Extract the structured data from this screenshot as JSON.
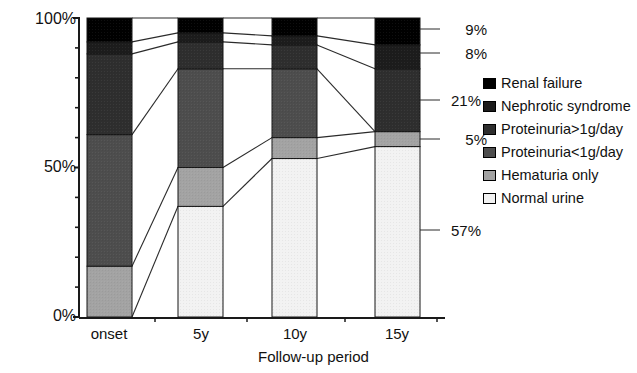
{
  "chart_data": {
    "type": "bar",
    "subtype": "100% stacked bar with connecting bands",
    "title": "",
    "xlabel": "Follow-up period",
    "ylabel": "",
    "categories": [
      "onset",
      "5y",
      "10y",
      "15y"
    ],
    "ylim": [
      0,
      100
    ],
    "ytick_labels": [
      "0%",
      "50%",
      "100%"
    ],
    "ytick_values": [
      0,
      50,
      100
    ],
    "minor_tick_step": 10,
    "grid": false,
    "legend_position": "right",
    "series": [
      {
        "name": "Renal failure",
        "color": "#000000",
        "values": [
          8,
          5,
          6,
          9
        ]
      },
      {
        "name": "Nephrotic syndrome",
        "color": "#1c1c1c",
        "values": [
          4,
          3,
          3,
          8
        ]
      },
      {
        "name": "Proteinuria>1g/day",
        "color": "#2e2e2e",
        "values": [
          27,
          9,
          8,
          21
        ]
      },
      {
        "name": "Proteinuria<1g/day",
        "color": "#4d4d4d",
        "values": [
          44,
          33,
          23,
          0
        ]
      },
      {
        "name": "Hematuria only",
        "color": "#a3a3a3",
        "values": [
          17,
          13,
          7,
          5
        ]
      },
      {
        "name": "Normal urine",
        "color": "#f2f2f2",
        "values": [
          0,
          37,
          53,
          57
        ]
      }
    ],
    "end_value_labels": [
      {
        "text": "9%",
        "series": "Renal failure"
      },
      {
        "text": "8%",
        "series": "Nephrotic syndrome"
      },
      {
        "text": "21%",
        "series": "Proteinuria>1g/day"
      },
      {
        "text": "5%",
        "series": "Hematuria only"
      },
      {
        "text": "57%",
        "series": "Normal urine"
      }
    ]
  },
  "axis": {
    "y_top_label": "100%",
    "y_mid_label": "50%",
    "y_bottom_label": "0%",
    "x_title": "Follow-up period",
    "x_ticks": [
      "onset",
      "5y",
      "10y",
      "15y"
    ]
  },
  "callouts": {
    "renal_failure": "9%",
    "nephrotic_syndrome": "8%",
    "proteinuria_gt": "21%",
    "hematuria": "5%",
    "normal_urine": "57%"
  },
  "legend": {
    "items": [
      {
        "label": "Renal failure",
        "swatch": "#000000"
      },
      {
        "label": "Nephrotic syndrome",
        "swatch": "#1c1c1c"
      },
      {
        "label": "Proteinuria>1g/day",
        "swatch": "#2e2e2e"
      },
      {
        "label": "Proteinuria<1g/day",
        "swatch": "#4d4d4d"
      },
      {
        "label": "Hematuria only",
        "swatch": "#a3a3a3"
      },
      {
        "label": "Normal urine",
        "swatch": "#f2f2f2"
      }
    ]
  }
}
